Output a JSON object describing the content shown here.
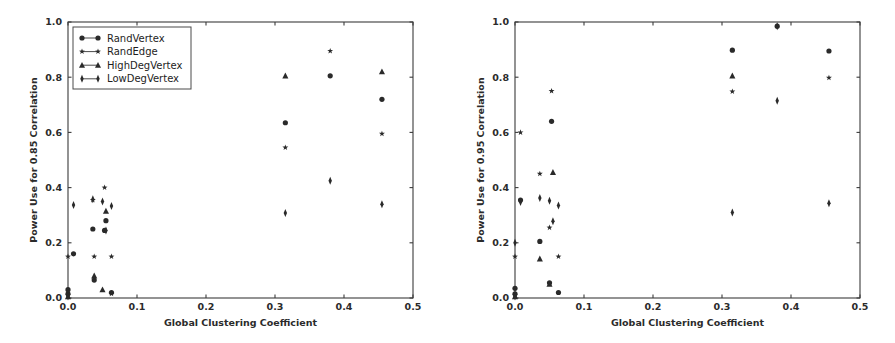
{
  "figure": {
    "background": "#ffffff",
    "marker_color": "#2a2a2a",
    "axis_color": "#3b3b3b"
  },
  "chart_data": [
    {
      "panel": "left",
      "type": "scatter",
      "title": "",
      "xlabel": "Global Clustering Coefficient",
      "ylabel": "Power Use for 0.85 Correlation",
      "xlim": [
        0.0,
        0.5
      ],
      "ylim": [
        0.0,
        1.0
      ],
      "xticks": [
        0.0,
        0.1,
        0.2,
        0.3,
        0.4,
        0.5
      ],
      "xticklabels": [
        "0.0",
        "0.1",
        "0.2",
        "0.3",
        "0.4",
        "0.5"
      ],
      "yticks": [
        0.0,
        0.2,
        0.4,
        0.6,
        0.8,
        1.0
      ],
      "yticklabels": [
        "0.0",
        "0.2",
        "0.4",
        "0.6",
        "0.8",
        "1.0"
      ],
      "grid": false,
      "legend": {
        "visible": true,
        "position": "upper left",
        "entries": [
          "RandVertex",
          "RandEdge",
          "HighDegVertex",
          "LowDegVertex"
        ]
      },
      "series": [
        {
          "name": "RandVertex",
          "marker": "circle",
          "points": [
            [
              0.0,
              0.015
            ],
            [
              0.0,
              0.03
            ],
            [
              0.008,
              0.16
            ],
            [
              0.036,
              0.25
            ],
            [
              0.038,
              0.065
            ],
            [
              0.053,
              0.245
            ],
            [
              0.055,
              0.28
            ],
            [
              0.063,
              0.02
            ],
            [
              0.315,
              0.635
            ],
            [
              0.38,
              0.805
            ],
            [
              0.455,
              0.72
            ]
          ]
        },
        {
          "name": "RandEdge",
          "marker": "star",
          "points": [
            [
              0.0,
              0.15
            ],
            [
              0.0,
              0.01
            ],
            [
              0.036,
              0.355
            ],
            [
              0.038,
              0.15
            ],
            [
              0.053,
              0.4
            ],
            [
              0.063,
              0.15
            ],
            [
              0.063,
              0.015
            ],
            [
              0.315,
              0.545
            ],
            [
              0.38,
              0.895
            ],
            [
              0.455,
              0.595
            ]
          ]
        },
        {
          "name": "HighDegVertex",
          "marker": "triangle",
          "points": [
            [
              0.0,
              0.005
            ],
            [
              0.038,
              0.08
            ],
            [
              0.05,
              0.03
            ],
            [
              0.055,
              0.315
            ],
            [
              0.315,
              0.805
            ],
            [
              0.455,
              0.82
            ]
          ]
        },
        {
          "name": "LowDegVertex",
          "marker": "thin_diamond",
          "points": [
            [
              0.0,
              0.005
            ],
            [
              0.008,
              0.337
            ],
            [
              0.036,
              0.358
            ],
            [
              0.05,
              0.35
            ],
            [
              0.063,
              0.333
            ],
            [
              0.055,
              0.245
            ],
            [
              0.315,
              0.308
            ],
            [
              0.38,
              0.425
            ],
            [
              0.455,
              0.34
            ]
          ]
        }
      ]
    },
    {
      "panel": "right",
      "type": "scatter",
      "title": "",
      "xlabel": "Global Clustering Coefficient",
      "ylabel": "Power Use for 0.95 Correlation",
      "xlim": [
        0.0,
        0.5
      ],
      "ylim": [
        0.0,
        1.0
      ],
      "xticks": [
        0.0,
        0.1,
        0.2,
        0.3,
        0.4,
        0.5
      ],
      "xticklabels": [
        "0.0",
        "0.1",
        "0.2",
        "0.3",
        "0.4",
        "0.5"
      ],
      "yticks": [
        0.0,
        0.2,
        0.4,
        0.6,
        0.8,
        1.0
      ],
      "yticklabels": [
        "0.0",
        "0.2",
        "0.4",
        "0.6",
        "0.8",
        "1.0"
      ],
      "grid": false,
      "legend": {
        "visible": false,
        "position": "",
        "entries": []
      },
      "series": [
        {
          "name": "RandVertex",
          "marker": "circle",
          "points": [
            [
              0.0,
              0.015
            ],
            [
              0.0,
              0.035
            ],
            [
              0.008,
              0.355
            ],
            [
              0.036,
              0.205
            ],
            [
              0.053,
              0.64
            ],
            [
              0.05,
              0.055
            ],
            [
              0.063,
              0.02
            ],
            [
              0.315,
              0.898
            ],
            [
              0.38,
              0.985
            ],
            [
              0.455,
              0.895
            ]
          ]
        },
        {
          "name": "RandEdge",
          "marker": "star",
          "points": [
            [
              0.0,
              0.15
            ],
            [
              0.0,
              0.01
            ],
            [
              0.008,
              0.6
            ],
            [
              0.036,
              0.45
            ],
            [
              0.05,
              0.255
            ],
            [
              0.053,
              0.75
            ],
            [
              0.063,
              0.15
            ],
            [
              0.315,
              0.748
            ],
            [
              0.455,
              0.798
            ]
          ]
        },
        {
          "name": "HighDegVertex",
          "marker": "triangle",
          "points": [
            [
              0.0,
              0.005
            ],
            [
              0.036,
              0.142
            ],
            [
              0.055,
              0.455
            ],
            [
              0.05,
              0.05
            ],
            [
              0.315,
              0.805
            ]
          ]
        },
        {
          "name": "LowDegVertex",
          "marker": "thin_diamond",
          "points": [
            [
              0.0,
              0.005
            ],
            [
              0.0,
              0.2
            ],
            [
              0.008,
              0.348
            ],
            [
              0.036,
              0.362
            ],
            [
              0.05,
              0.352
            ],
            [
              0.055,
              0.278
            ],
            [
              0.063,
              0.335
            ],
            [
              0.315,
              0.31
            ],
            [
              0.38,
              0.715
            ],
            [
              0.38,
              0.985
            ],
            [
              0.455,
              0.343
            ]
          ]
        }
      ]
    }
  ]
}
